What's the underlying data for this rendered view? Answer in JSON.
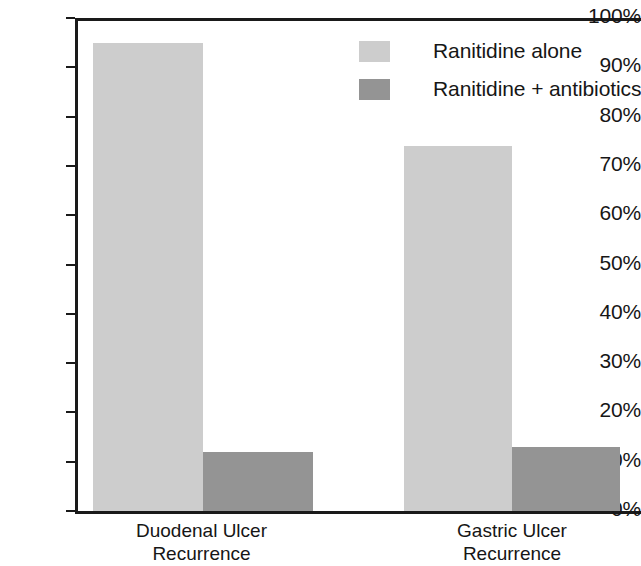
{
  "chart_data": {
    "type": "bar",
    "title": "",
    "subtitle": "",
    "xlabel": "",
    "ylabel": "",
    "categories": [
      "Duodenal Ulcer Recurrence",
      "Gastric Ulcer Recurrence"
    ],
    "category_lines": [
      [
        "Duodenal Ulcer",
        "Recurrence"
      ],
      [
        "Gastric Ulcer",
        "Recurrence"
      ]
    ],
    "series": [
      {
        "name": "Ranitidine alone",
        "color": "#cdcdcd",
        "values": [
          95,
          74
        ]
      },
      {
        "name": "Ranitidine + antibiotics",
        "color": "#949494",
        "values": [
          12,
          13
        ]
      }
    ],
    "ylim": [
      0,
      100
    ],
    "y_ticks": [
      0,
      10,
      20,
      30,
      40,
      50,
      60,
      70,
      80,
      90,
      100
    ],
    "y_tick_labels": [
      "0%",
      "10%",
      "20%",
      "30%",
      "40%",
      "50%",
      "60%",
      "70%",
      "80%",
      "90%",
      "100%"
    ],
    "grid": false,
    "legend_position": "top-right",
    "value_suffix": "%"
  },
  "legend": {
    "entries": [
      {
        "label": "Ranitidine alone",
        "color": "#cdcdcd"
      },
      {
        "label": "Ranitidine + antibiotics",
        "color": "#949494"
      }
    ]
  },
  "axis": {
    "tick_labels": [
      "100%",
      "90%",
      "80%",
      "70%",
      "60%",
      "50%",
      "40%",
      "30%",
      "20%",
      "10%",
      "0%"
    ]
  }
}
